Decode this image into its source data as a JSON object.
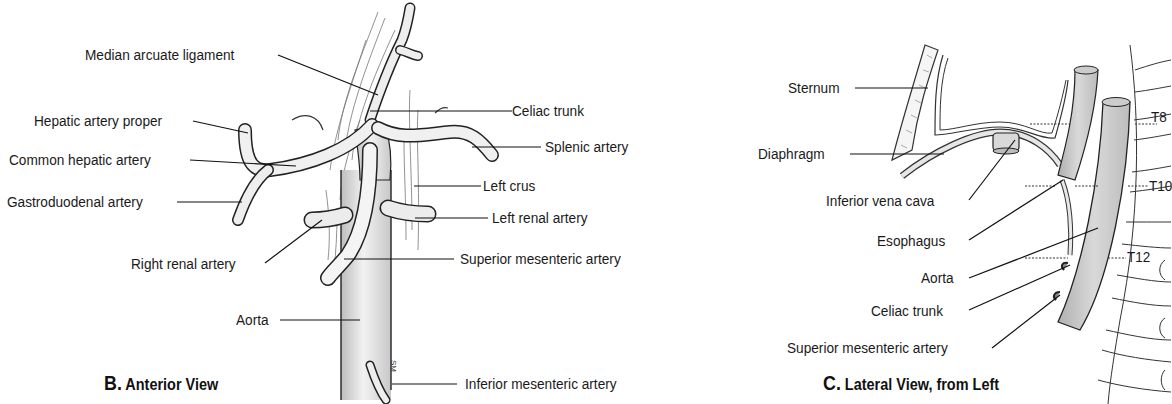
{
  "panels": [
    {
      "id": "B",
      "caption_letter": "B.",
      "caption_text": "Anterior View",
      "labels": [
        {
          "key": "median_arcuate_ligament",
          "text": "Median arcuate ligament"
        },
        {
          "key": "hepatic_artery_proper",
          "text": "Hepatic artery proper"
        },
        {
          "key": "common_hepatic_artery",
          "text": "Common hepatic artery"
        },
        {
          "key": "gastroduodenal_artery",
          "text": "Gastroduodenal artery"
        },
        {
          "key": "right_renal_artery",
          "text": "Right renal artery"
        },
        {
          "key": "aorta",
          "text": "Aorta"
        },
        {
          "key": "celiac_trunk",
          "text": "Celiac trunk"
        },
        {
          "key": "splenic_artery",
          "text": "Splenic artery"
        },
        {
          "key": "left_crus",
          "text": "Left crus"
        },
        {
          "key": "left_renal_artery",
          "text": "Left renal artery"
        },
        {
          "key": "superior_mesenteric_artery",
          "text": "Superior mesenteric artery"
        },
        {
          "key": "inferior_mesenteric_artery",
          "text": "Inferior mesenteric artery"
        }
      ]
    },
    {
      "id": "C",
      "caption_letter": "C.",
      "caption_text": "Lateral View, from Left",
      "labels": [
        {
          "key": "sternum",
          "text": "Sternum"
        },
        {
          "key": "diaphragm",
          "text": "Diaphragm"
        },
        {
          "key": "inferior_vena_cava",
          "text": "Inferior vena cava"
        },
        {
          "key": "esophagus",
          "text": "Esophagus"
        },
        {
          "key": "aorta",
          "text": "Aorta"
        },
        {
          "key": "celiac_trunk",
          "text": "Celiac trunk"
        },
        {
          "key": "superior_mesenteric_artery",
          "text": "Superior mesenteric artery"
        }
      ],
      "vertebra_levels": [
        "T8",
        "T10",
        "T12"
      ]
    }
  ],
  "artist_signature": "SM"
}
